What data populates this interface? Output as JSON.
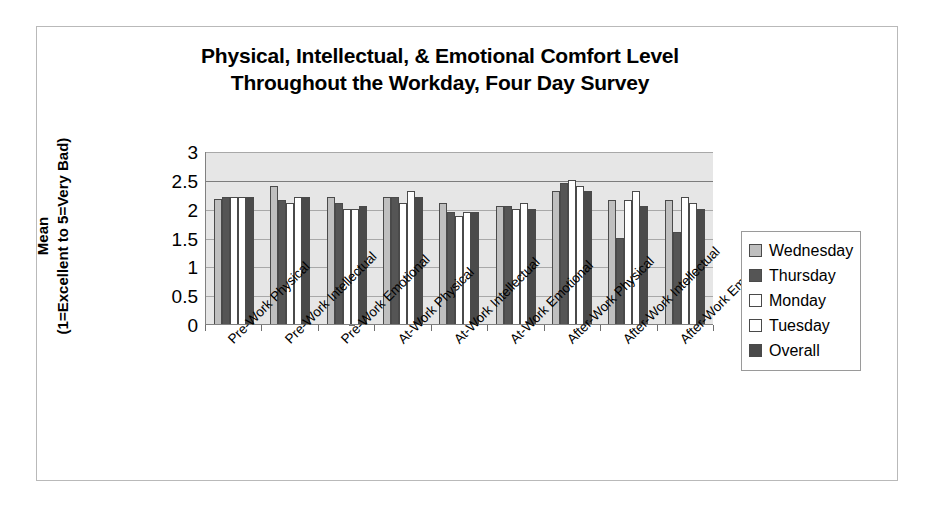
{
  "chart_data": {
    "type": "bar",
    "title": "Physical, Intellectual, & Emotional Comfort Level Throughout the Workday, Four Day Survey",
    "title_lines": [
      "Physical, Intellectual, & Emotional Comfort Level",
      "Throughout the Workday, Four Day Survey"
    ],
    "xlabel": "",
    "ylabel": "Mean (1=Excellent to 5=Very Bad)",
    "ylabel_lines": [
      "Mean",
      "(1=Excellent to 5=Very Bad)"
    ],
    "ylim": [
      0,
      3
    ],
    "ytick_labels": [
      "3",
      "2.5",
      "2",
      "1.5",
      "1",
      "0.5",
      "0"
    ],
    "ytick_values": [
      3,
      2.5,
      2,
      1.5,
      1,
      0.5,
      0
    ],
    "grid": true,
    "legend_position": "right",
    "categories": [
      "Pre-Work Physical",
      "Pre-Work Intellectual",
      "Pre-Work Emotional",
      "At-Work Physical",
      "At-Work Intellectual",
      "At-Work Emotional",
      "After-Work Physical",
      "After-Work Intellectual",
      "After-Work Emotional"
    ],
    "series": [
      {
        "name": "Wednesday",
        "color": "#bfbfbf",
        "values": [
          2.17,
          2.4,
          2.2,
          2.2,
          2.1,
          2.05,
          2.3,
          2.15,
          2.15
        ]
      },
      {
        "name": "Thursday",
        "color": "#555555",
        "values": [
          2.2,
          2.15,
          2.1,
          2.2,
          1.95,
          2.05,
          2.45,
          1.5,
          1.6
        ]
      },
      {
        "name": "Monday",
        "color": "#ffffff",
        "values": [
          2.2,
          2.1,
          2.0,
          2.1,
          1.87,
          2.0,
          2.5,
          2.15,
          2.2
        ]
      },
      {
        "name": "Tuesday",
        "color": "#ffffff",
        "values": [
          2.2,
          2.2,
          2.0,
          2.3,
          1.95,
          2.1,
          2.4,
          2.3,
          2.1
        ]
      },
      {
        "name": "Overall",
        "color": "#4a4a4a",
        "values": [
          2.2,
          2.2,
          2.05,
          2.2,
          1.95,
          2.0,
          2.3,
          2.05,
          2.0
        ]
      }
    ]
  }
}
